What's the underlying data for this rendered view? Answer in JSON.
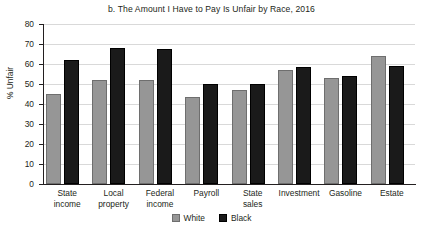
{
  "chart_data": {
    "type": "bar",
    "title": "b. The Amount I Have to Pay Is Unfair by Race, 2016",
    "xlabel": "",
    "ylabel": "% Unfair",
    "ylim": [
      0,
      80
    ],
    "ytick_step": 10,
    "yticks": [
      80,
      70,
      60,
      50,
      40,
      30,
      20,
      10,
      0
    ],
    "grid": true,
    "legend_position": "bottom-center",
    "categories": [
      "State income",
      "Local property",
      "Federal income",
      "Payroll",
      "State sales",
      "Investment",
      "Gasoline",
      "Estate"
    ],
    "category_lines": [
      [
        "State",
        "income"
      ],
      [
        "Local",
        "property"
      ],
      [
        "Federal",
        "income"
      ],
      [
        "Payroll",
        ""
      ],
      [
        "State",
        "sales"
      ],
      [
        "Investment",
        ""
      ],
      [
        "Gasoline",
        ""
      ],
      [
        "Estate",
        ""
      ]
    ],
    "series": [
      {
        "name": "White",
        "color": "#969696",
        "values": [
          45,
          52,
          52,
          43.5,
          47,
          57,
          53,
          64
        ]
      },
      {
        "name": "Black",
        "color": "#1a1a1a",
        "values": [
          62,
          68,
          67.5,
          50,
          50,
          58.5,
          54,
          59
        ]
      }
    ]
  },
  "legend": {
    "items": [
      {
        "label": "White",
        "swatch": "white-swatch-icon"
      },
      {
        "label": "Black",
        "swatch": "black-swatch-icon"
      }
    ]
  }
}
